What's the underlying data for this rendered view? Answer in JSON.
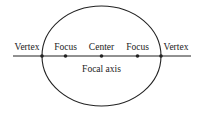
{
  "diagram": {
    "labels": {
      "vertex_left": "Vertex",
      "focus_left": "Focus",
      "center": "Center",
      "focus_right": "Focus",
      "vertex_right": "Vertex",
      "axis": "Focal axis"
    },
    "colors": {
      "stroke": "#222222",
      "background": "#ffffff"
    }
  }
}
